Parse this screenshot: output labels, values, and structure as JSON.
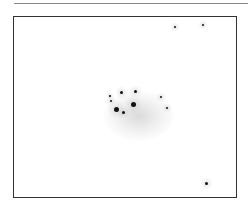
{
  "image": {
    "kind": "inverted-astronomical-star-field",
    "colors": {
      "background": "#ffffff",
      "frame": "#333333",
      "star": "#111111",
      "nebula": "#bbbbbb"
    },
    "stars": [
      {
        "x": 175,
        "y": 27,
        "r": 1
      },
      {
        "x": 203,
        "y": 25,
        "r": 1
      },
      {
        "x": 121,
        "y": 92,
        "r": 1.5
      },
      {
        "x": 135,
        "y": 91,
        "r": 1.5
      },
      {
        "x": 111,
        "y": 101,
        "r": 1
      },
      {
        "x": 116,
        "y": 109,
        "r": 2.5
      },
      {
        "x": 133,
        "y": 104,
        "r": 2.5
      },
      {
        "x": 123,
        "y": 112,
        "r": 1.5
      },
      {
        "x": 110,
        "y": 96,
        "r": 0.8
      },
      {
        "x": 161,
        "y": 97,
        "r": 1
      },
      {
        "x": 167,
        "y": 108,
        "r": 1
      },
      {
        "x": 206,
        "y": 183,
        "r": 1.5
      }
    ]
  }
}
